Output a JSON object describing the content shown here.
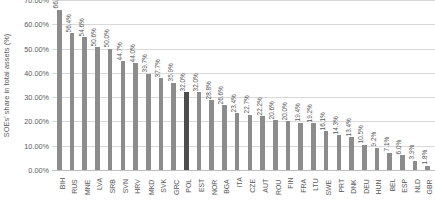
{
  "chart_data": {
    "type": "bar",
    "title": "",
    "xlabel": "",
    "ylabel": "SOEs' share in total assets (%)",
    "ylim": [
      0,
      70
    ],
    "ytick_labels": [
      "70.00%",
      "60.00%",
      "50.00%",
      "40.00%",
      "30.00%",
      "20.00%",
      "10.00%",
      "0.00%"
    ],
    "ytick_values": [
      70,
      60,
      50,
      40,
      30,
      20,
      10,
      0
    ],
    "grid": true,
    "legend": "none",
    "bar_color": "#8c8c8c",
    "highlight_color": "#4d4d4d",
    "highlight_category": "POL",
    "categories": [
      "BIH",
      "RUS",
      "MNE",
      "LVA",
      "SRB",
      "SVN",
      "HRV",
      "MKD",
      "SVK",
      "GRC",
      "POL",
      "EST",
      "NOR",
      "BGA",
      "ITA",
      "CZE",
      "AUT",
      "ROU",
      "FIN",
      "FRA",
      "LTU",
      "SWE",
      "PRT",
      "DNK",
      "DEU",
      "HUN",
      "BEL",
      "ESP",
      "NLD",
      "GBR"
    ],
    "values": [
      66.0,
      56.4,
      54.6,
      50.6,
      50.0,
      44.7,
      44.0,
      39.7,
      37.7,
      35.9,
      32.0,
      32.0,
      28.8,
      26.6,
      23.4,
      22.7,
      22.2,
      20.6,
      20.0,
      19.4,
      19.2,
      16.1,
      14.3,
      13.4,
      10.5,
      9.2,
      7.1,
      6.0,
      3.9,
      1.8
    ],
    "data_labels": [
      "66.0%",
      "56.4%",
      "54.6%",
      "50.6%",
      "50.0%",
      "44.7%",
      "44.0%",
      "39.7%",
      "37.7%",
      "35.9%",
      "32.0%",
      "32.0%",
      "28.8%",
      "26.6%",
      "23.4%",
      "22.7%",
      "22.2%",
      "20.6%",
      "20.0%",
      "19.4%",
      "19.2%",
      "16.1%",
      "14.3%",
      "13.4%",
      "10.5%",
      "9.2%",
      "7.1%",
      "6.0%",
      "3.9%",
      "1.8%"
    ]
  }
}
